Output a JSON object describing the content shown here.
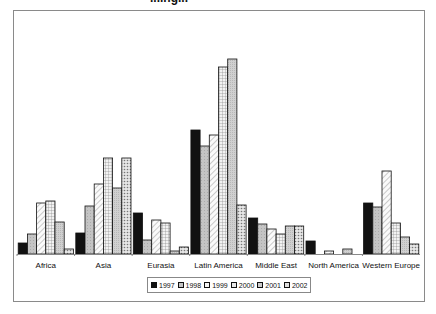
{
  "chart_data": {
    "type": "bar",
    "title": "",
    "xlabel": "",
    "ylabel": "",
    "grid": false,
    "legend_position": "bottom",
    "categories": [
      "Africa",
      "Asia",
      "Eurasia",
      "Latin America",
      "Middle East",
      "North America",
      "Western Europe"
    ],
    "series": [
      {
        "name": "1997",
        "values": [
          11,
          21,
          41,
          124,
          36,
          13,
          51
        ]
      },
      {
        "name": "1998",
        "values": [
          20,
          48,
          14,
          108,
          30,
          0,
          47
        ]
      },
      {
        "name": "1999",
        "values": [
          51,
          70,
          34,
          119,
          25,
          3,
          83
        ]
      },
      {
        "name": "2000",
        "values": [
          53,
          96,
          31,
          187,
          20,
          0,
          31
        ]
      },
      {
        "name": "2001",
        "values": [
          32,
          66,
          3,
          195,
          28,
          5,
          17
        ]
      },
      {
        "name": "2002",
        "values": [
          5,
          96,
          7,
          49,
          28,
          0,
          10
        ]
      }
    ],
    "ylim": [
      0,
      200
    ],
    "units_note": "relative values estimated from bar heights (no y-axis shown)"
  },
  "legend": {
    "items": [
      {
        "label": "1997",
        "fill": "#111111"
      },
      {
        "label": "1998",
        "fill": "#c8c8c8"
      },
      {
        "label": "1999",
        "fill": "#f0f0f0"
      },
      {
        "label": "2000",
        "fill": "#e0e0e0"
      },
      {
        "label": "2001",
        "fill": "#cfcfcf"
      },
      {
        "label": "2002",
        "fill": "#d8d8d8"
      }
    ]
  },
  "title_fragment": "...ing..."
}
